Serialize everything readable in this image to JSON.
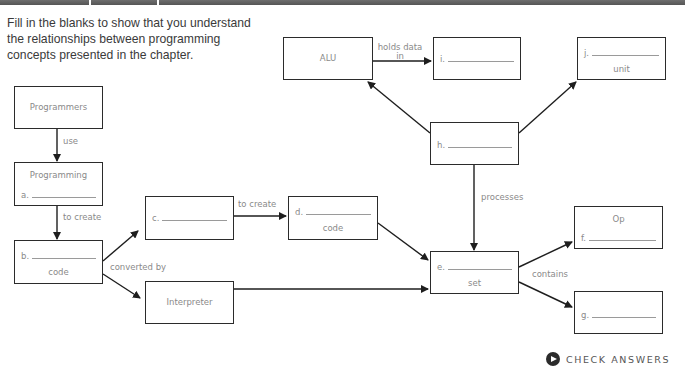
{
  "intro_text": "Fill in the blanks to show that you understand the relationships between programming concepts presented in the chapter.",
  "boxes": {
    "programmers": {
      "title": "Programmers"
    },
    "programming": {
      "title": "Programming",
      "letter": "a."
    },
    "b": {
      "letter": "b.",
      "sub": "code"
    },
    "c": {
      "letter": "c."
    },
    "interpreter": {
      "title": "Interpreter"
    },
    "d": {
      "letter": "d.",
      "sub": "code"
    },
    "e": {
      "letter": "e.",
      "sub": "set"
    },
    "op": {
      "title": "Op",
      "letter": "f."
    },
    "g": {
      "letter": "g."
    },
    "h": {
      "letter": "h."
    },
    "alu": {
      "title": "ALU"
    },
    "i": {
      "letter": "i."
    },
    "j": {
      "letter": "j.",
      "sub": "unit"
    }
  },
  "labels": {
    "use": "use",
    "to_create_1": "to create",
    "converted_by": "converted by",
    "to_create_2": "to create",
    "processes": "processes",
    "contains": "contains",
    "holds_data_in_1": "holds data",
    "holds_data_in_2": "in"
  },
  "check_answers": {
    "label": "CHECK ANSWERS",
    "icon": "play-circle-icon"
  },
  "colors": {
    "box_border": "#2b2b2b",
    "label_text": "#8a8a8a",
    "intro_text": "#3a3a3a"
  }
}
